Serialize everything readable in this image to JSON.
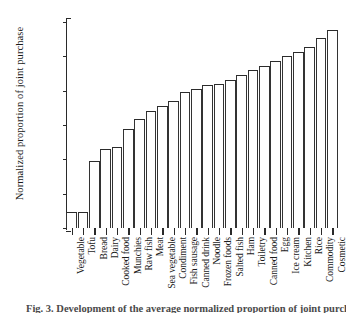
{
  "chart_data": {
    "type": "bar",
    "title": "",
    "xlabel": "",
    "ylabel": "Normalized proportion of joint purchase",
    "ylim": [
      30000,
      0
    ],
    "y_axis_inverted": true,
    "grid": false,
    "legend": null,
    "ytick_labels": [
      "0",
      "5,000",
      "10,000",
      "15,000",
      "20,000",
      "25,000",
      "30,000"
    ],
    "ytick_values": [
      0,
      5000,
      10000,
      15000,
      20000,
      25000,
      30000
    ],
    "categories": [
      "Vegetable",
      "Tofu",
      "Bread",
      "Dairy",
      "Cooked food",
      "Munchies",
      "Raw fish",
      "Meat",
      "Sea vegetable",
      "Condiment",
      "Fish sausage",
      "Canned drink",
      "Noodle",
      "Frozen foods",
      "Salted fish",
      "Ham",
      "Toiletry",
      "Canned food",
      "Egg",
      "Ice cream",
      "Kitchen",
      "Rice",
      "Commodity",
      "Cosmetic"
    ],
    "values": [
      27700,
      27600,
      20200,
      18500,
      18200,
      15600,
      14100,
      12900,
      12300,
      11500,
      10200,
      9700,
      9200,
      9000,
      8500,
      7700,
      7000,
      6400,
      5700,
      5000,
      4300,
      3600,
      2400,
      1200
    ]
  },
  "caption": {
    "text": "Fig. 3. Development of the average normalized proportion of joint purchase"
  },
  "colors": {
    "bar_outline": "#2b2b2b",
    "axis": "#2a2a2a",
    "background": "#ffffff",
    "text": "#1a1a1a"
  }
}
